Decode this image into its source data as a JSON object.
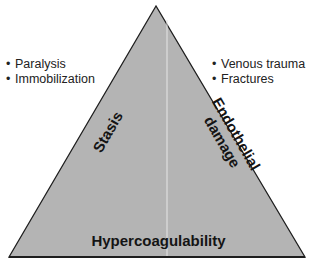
{
  "diagram": {
    "type": "triangle",
    "fill_color": "#b4b4b4",
    "stroke_color": "#1e1e1e",
    "divider_color": "#e6e6e6",
    "sides": {
      "left": "Stasis",
      "right_line1": "Endothelial",
      "right_line2": "damage",
      "base": "Hypercoagulability"
    }
  },
  "left_list": {
    "bullet": "•",
    "items": [
      "Paralysis",
      "Immobilization"
    ]
  },
  "right_list": {
    "bullet": "•",
    "items": [
      "Venous trauma",
      "Fractures"
    ]
  }
}
